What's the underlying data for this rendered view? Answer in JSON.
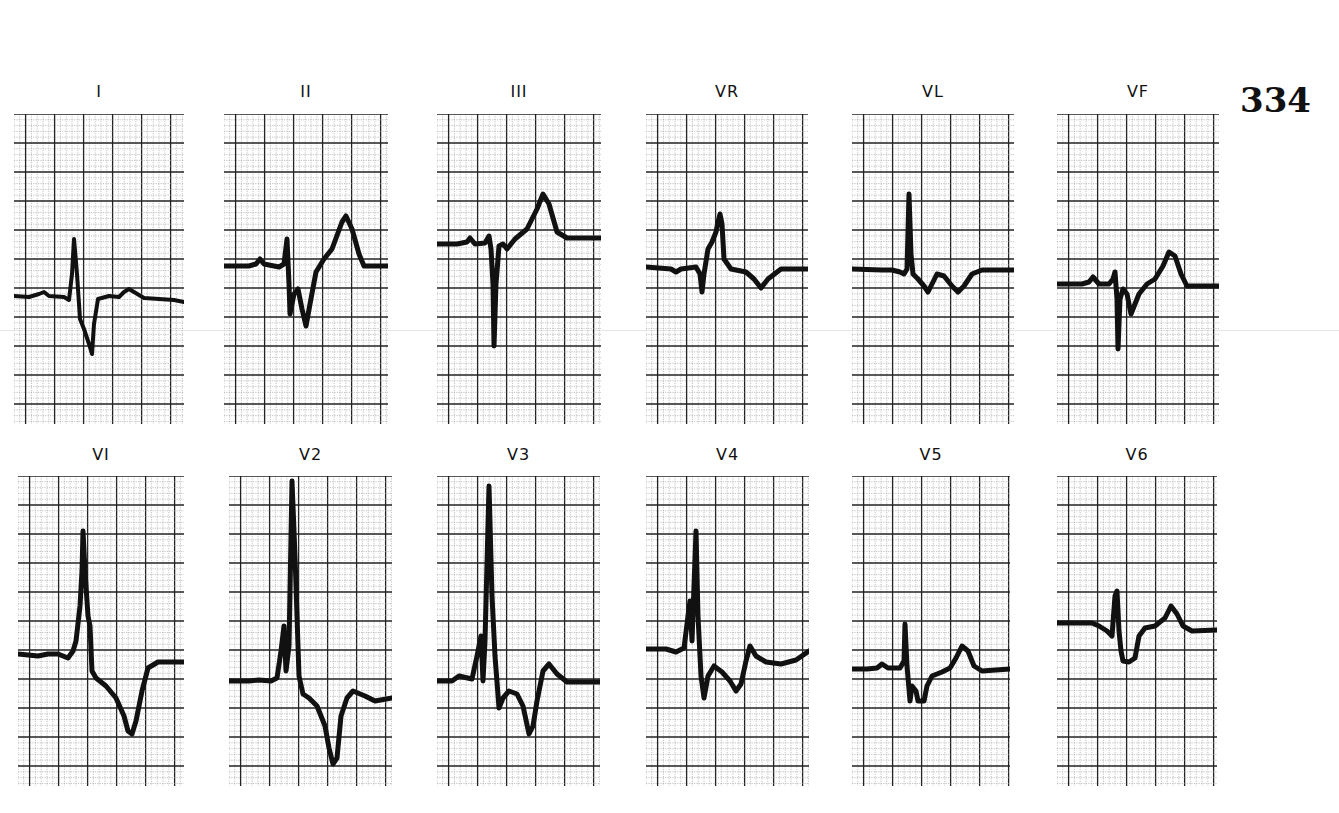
{
  "figure_number": "334",
  "grid": {
    "minor_px": 5.8,
    "major_every": 5,
    "minor_color": "#9a9a9a",
    "major_color": "#222222"
  },
  "trace_color": "#111111",
  "leads": [
    {
      "id": "I",
      "label": "I",
      "x": 14,
      "y": 114,
      "w": 170,
      "h": 310,
      "label_y": 82,
      "points": "0,182 15,183 25,180 30,178 35,182 50,183 55,186 58,160 60,125 63,160 66,205 70,215 75,230 78,240 80,210 84,185 95,182 105,183 110,178 115,175 120,178 130,184 145,185 160,186 170,188",
      "width": 4
    },
    {
      "id": "II",
      "label": "II",
      "x": 224,
      "y": 114,
      "w": 164,
      "h": 310,
      "label_y": 82,
      "points": "0,152 25,152 32,150 36,145 40,150 55,153 60,150 63,125 65,170 66,200 70,180 74,175 78,195 82,212 86,190 92,158 100,145 108,135 118,108 122,102 128,115 135,140 140,152 164,152",
      "width": 5
    },
    {
      "id": "III",
      "label": "III",
      "x": 437,
      "y": 114,
      "w": 164,
      "h": 310,
      "label_y": 82,
      "points": "0,130 20,130 30,128 33,124 38,130 48,129 52,122 54,135 56,170 57,232 59,170 62,132 66,130 70,135 78,125 90,115 100,95 106,80 112,90 120,118 130,124 164,124",
      "width": 5
    },
    {
      "id": "VR",
      "label": "VR",
      "x": 646,
      "y": 114,
      "w": 162,
      "h": 310,
      "label_y": 82,
      "points": "0,153 25,155 30,158 35,155 50,153 54,160 56,178 58,160 62,135 66,128 70,118 72,108 74,100 76,110 78,145 85,155 100,158 108,165 115,174 122,165 135,155 162,155",
      "width": 5
    },
    {
      "id": "VL",
      "label": "VL",
      "x": 852,
      "y": 114,
      "w": 162,
      "h": 310,
      "label_y": 82,
      "points": "0,155 30,156 40,156 48,158 52,160 55,155 57,80 59,140 61,160 66,165 72,172 76,178 80,170 85,160 92,162 100,172 106,178 112,172 120,160 130,156 162,156",
      "width": 5
    },
    {
      "id": "VF",
      "label": "VF",
      "x": 1057,
      "y": 114,
      "w": 162,
      "h": 310,
      "label_y": 82,
      "points": "0,170 25,170 32,168 36,163 42,170 52,170 56,165 58,158 60,185 61,235 63,185 66,175 70,180 74,200 78,190 82,180 90,170 98,165 106,152 112,138 118,142 124,160 130,172 162,172",
      "width": 5
    },
    {
      "id": "V1",
      "label": "VI",
      "x": 18,
      "y": 476,
      "w": 166,
      "h": 310,
      "label_y": 445,
      "points": "0,178 20,180 30,178 40,178 50,182 55,175 58,165 62,130 64,95 65,55 67,95 70,140 72,150 74,195 78,202 88,210 98,222 106,240 110,255 114,258 118,245 124,215 130,192 140,186 166,186",
      "width": 5
    },
    {
      "id": "V2",
      "label": "V2",
      "x": 229,
      "y": 476,
      "w": 163,
      "h": 310,
      "label_y": 445,
      "points": "0,205 20,205 30,204 42,205 48,202 52,175 55,150 57,195 60,170 63,5 66,80 70,200 74,218 80,222 88,230 96,250 100,272 104,288 108,282 112,240 118,222 124,215 136,220 146,225 163,222",
      "width": 5
    },
    {
      "id": "V3",
      "label": "V3",
      "x": 437,
      "y": 476,
      "w": 163,
      "h": 310,
      "label_y": 445,
      "points": "0,205 15,205 22,200 35,203 40,180 44,160 46,205 48,165 52,10 55,120 58,180 62,232 66,222 72,215 80,218 86,230 92,258 96,250 100,225 106,195 112,188 120,198 130,206 163,206",
      "width": 5
    },
    {
      "id": "V4",
      "label": "V4",
      "x": 646,
      "y": 476,
      "w": 163,
      "h": 310,
      "label_y": 445,
      "points": "0,173 20,173 30,176 38,172 42,140 44,125 46,165 48,110 50,55 52,140 55,200 58,222 62,200 68,190 76,196 84,205 90,215 95,208 100,185 104,170 110,180 120,186 135,188 150,184 163,175",
      "width": 5
    },
    {
      "id": "V5",
      "label": "V5",
      "x": 852,
      "y": 476,
      "w": 158,
      "h": 310,
      "label_y": 445,
      "points": "0,193 15,193 25,192 30,188 36,192 48,192 52,185 53,148 55,190 58,225 60,210 64,215 66,225 72,225 75,210 80,200 90,196 98,192 104,182 110,170 116,175 122,190 130,195 158,193",
      "width": 5
    },
    {
      "id": "V6",
      "label": "V6",
      "x": 1057,
      "y": 476,
      "w": 160,
      "h": 310,
      "label_y": 445,
      "points": "0,147 25,147 35,147 42,150 50,155 55,160 58,120 60,115 62,155 64,175 66,185 72,186 78,182 82,160 88,152 98,150 108,142 114,130 120,138 126,150 135,155 160,154",
      "width": 5
    }
  ]
}
